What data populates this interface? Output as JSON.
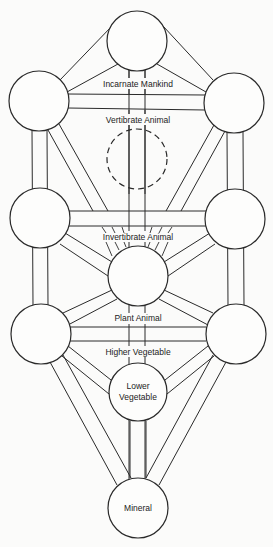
{
  "diagram": {
    "colors": {
      "background": "#fbfbfa",
      "stroke": "#2a2a2a",
      "text": "#222222"
    },
    "nodes": [
      {
        "id": "top",
        "cx": 137,
        "cy": 41,
        "r": 30,
        "label": ""
      },
      {
        "id": "upper-left",
        "cx": 39,
        "cy": 101,
        "r": 30,
        "label": ""
      },
      {
        "id": "upper-right",
        "cx": 234,
        "cy": 103,
        "r": 30,
        "label": ""
      },
      {
        "id": "hidden",
        "cx": 137,
        "cy": 159,
        "r": 30,
        "label": "",
        "dashed": true
      },
      {
        "id": "middle-left",
        "cx": 40,
        "cy": 218,
        "r": 30,
        "label": ""
      },
      {
        "id": "middle-right",
        "cx": 235,
        "cy": 219,
        "r": 30,
        "label": ""
      },
      {
        "id": "center",
        "cx": 138,
        "cy": 276,
        "r": 30,
        "label": ""
      },
      {
        "id": "lower-left",
        "cx": 41,
        "cy": 334,
        "r": 30,
        "label": ""
      },
      {
        "id": "lower-right",
        "cx": 236,
        "cy": 334,
        "r": 30,
        "label": ""
      },
      {
        "id": "lower-vegetable",
        "cx": 138,
        "cy": 392,
        "r": 29,
        "label_lines": [
          "Lower",
          "Vegetable"
        ]
      },
      {
        "id": "mineral",
        "cx": 138,
        "cy": 508,
        "r": 30,
        "label": "Mineral"
      }
    ],
    "labels": {
      "incarnate_mankind": "Incarnate Mankind",
      "vertibrate_animal": "Vertibrate Animal",
      "invertibrate_animal": "Invertibrate Animal",
      "plant_animal": "Plant Animal",
      "higher_vegetable": "Higher Vegetable",
      "lower_vegetable_line1": "Lower",
      "lower_vegetable_line2": "Vegetable",
      "mineral": "Mineral"
    }
  }
}
